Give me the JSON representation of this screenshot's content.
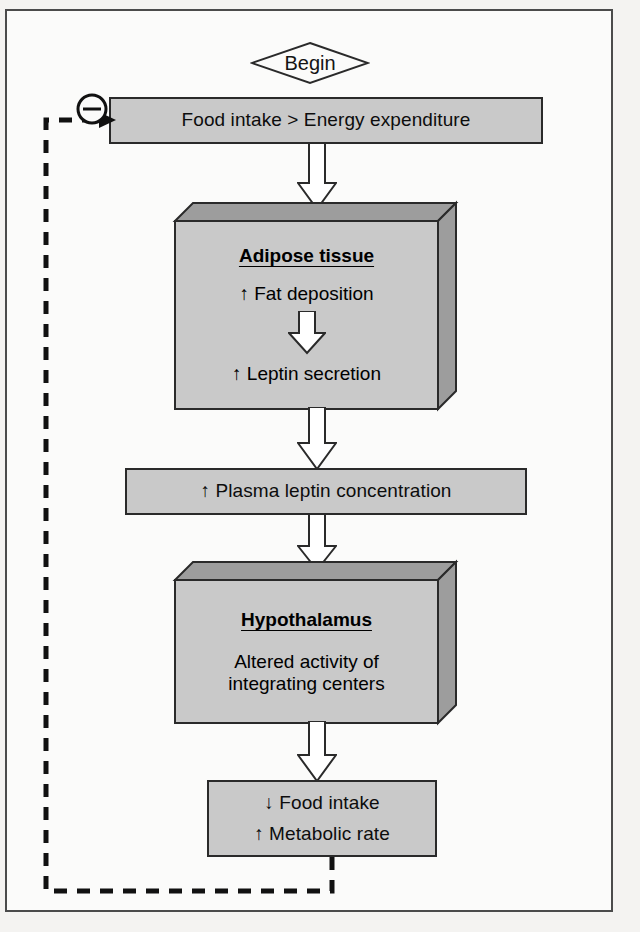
{
  "diagram": {
    "type": "flowchart",
    "start_node": {
      "label": "Begin",
      "shape": "diamond"
    },
    "feedback_symbol": {
      "label": "⊖",
      "meaning": "negative-feedback"
    },
    "nodes": [
      {
        "id": "food-intake-vs-expenditure",
        "shape": "rect",
        "lines": [
          "Food intake > Energy expenditure"
        ]
      },
      {
        "id": "adipose-tissue",
        "shape": "box3d",
        "title": "Adipose tissue",
        "lines": [
          "↑ Fat deposition",
          "↑ Leptin secretion"
        ]
      },
      {
        "id": "plasma-leptin",
        "shape": "rect",
        "lines": [
          "↑ Plasma leptin concentration"
        ]
      },
      {
        "id": "hypothalamus",
        "shape": "box3d",
        "title": "Hypothalamus",
        "lines": [
          "Altered activity of",
          "integrating centers"
        ]
      },
      {
        "id": "response",
        "shape": "rect",
        "lines": [
          "↓ Food intake",
          "↑ Metabolic rate"
        ]
      }
    ],
    "text": {
      "begin": "Begin",
      "minus": "⊖",
      "box1_line1": "Food intake > Energy expenditure",
      "adipose_title": "Adipose tissue",
      "adipose_line1": "↑ Fat deposition",
      "adipose_line2": "↑ Leptin secretion",
      "plasma_line1": "↑ Plasma leptin concentration",
      "hypo_title": "Hypothalamus",
      "hypo_line1": "Altered activity of",
      "hypo_line2": "integrating centers",
      "response_line1": "↓ Food intake",
      "response_line2": "↑ Metabolic rate"
    },
    "colors": {
      "node_fill": "#c9c9c9",
      "node_shade": "#9d9d9d",
      "outline": "#2a2a2a",
      "page_background": "#fbfbfa",
      "frame_border": "#4b4b4b",
      "arrow_fill": "#ffffff"
    }
  }
}
